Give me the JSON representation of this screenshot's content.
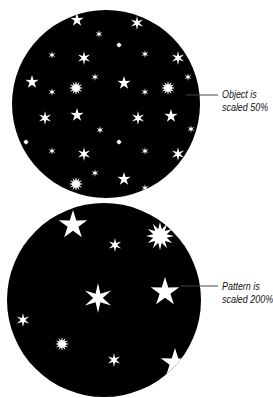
{
  "figure": {
    "top_panel": {
      "label_line1": "Object is",
      "label_line2": "scaled 50%",
      "circle": {
        "cx": 106,
        "cy": 104,
        "r": 94,
        "fill": "#000000"
      },
      "star_color": "#ffffff"
    },
    "bottom_panel": {
      "label_line1": "Pattern is",
      "label_line2": "scaled 200%",
      "circle": {
        "cx": 104,
        "cy": 300,
        "r": 97,
        "fill": "#000000"
      },
      "star_color": "#ffffff"
    },
    "leader_line_color": "#444444"
  }
}
